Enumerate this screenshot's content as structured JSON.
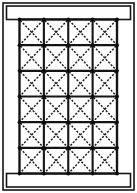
{
  "figure": {
    "title": "Braced frame elevation",
    "canvas": {
      "width": 137,
      "height": 193,
      "background": "#ffffff"
    }
  },
  "colors": {
    "line": "#141414",
    "grid_line": "#141414",
    "brace_line": "#1a1a1a",
    "node": "#0d0d0d",
    "background": "#ffffff",
    "cell_fill": "#ffffff"
  },
  "outer_frame": {
    "label": "outer frame",
    "x": 3.0,
    "y": 3.0,
    "width": 131.0,
    "height": 187.0,
    "stroke_width": 1.6
  },
  "bands": [
    {
      "label": "top band beam",
      "name": "top-band",
      "x": 6.5,
      "y": 6.0,
      "width": 124.0,
      "height": 13.5,
      "stroke_width": 1.6
    },
    {
      "label": "bottom band beam",
      "name": "bottom-band",
      "x": 6.5,
      "y": 173.5,
      "width": 124.0,
      "height": 13.5,
      "stroke_width": 1.6
    }
  ],
  "grid": {
    "label": "braced grid",
    "columns": 4,
    "rows": 6,
    "x": 19.5,
    "y": 19.5,
    "width": 97.5,
    "height": 154.0,
    "cell_width": 24.375,
    "cell_height": 25.6667,
    "line_stroke_width": 2.1,
    "outer_stroke_width": 2.4,
    "node_radius": 1.9,
    "brace": {
      "style": "dashed",
      "type": "cross",
      "stroke_width": 1.45,
      "dash_on": 2.1,
      "dash_off": 1.5
    }
  },
  "chart_data": {
    "type": "diagram",
    "title": "Braced frame elevation",
    "bays": 4,
    "storeys": 6,
    "panels_total": 24,
    "braces_per_panel": 2,
    "braces_total": 48,
    "column_lines": 5,
    "beam_lines": 7,
    "node_count": 35,
    "band_beams": 2
  }
}
